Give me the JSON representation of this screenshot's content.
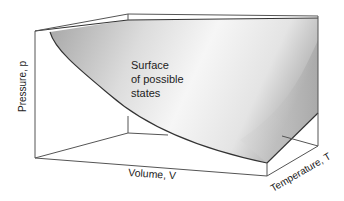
{
  "diagram": {
    "surface_label": [
      "Surface",
      "of possible",
      "states"
    ],
    "axes": {
      "pressure": "Pressure, p",
      "volume": "Volume, V",
      "temperature": "Temperature, T"
    },
    "colors": {
      "surface_dark": "#a8a8a8",
      "surface_light": "#f4f4f4",
      "edge": "#555555",
      "text": "#222222"
    }
  }
}
